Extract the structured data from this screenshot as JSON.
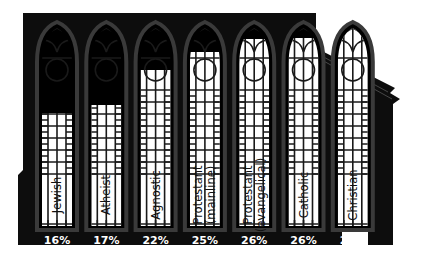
{
  "chart_data": {
    "type": "bar",
    "title": "",
    "xlabel": "",
    "ylabel": "",
    "ylim": [
      0,
      28
    ],
    "grid": false,
    "legend": null,
    "style": "pictogram: church facade with stained-glass windows filled to each value",
    "categories": [
      "Jewish",
      "Atheist",
      "Agnostic",
      "Protestant (mainline)",
      "Protestant (evangelical)",
      "Catholic",
      "Christian"
    ],
    "category_lines": [
      [
        "Jewish"
      ],
      [
        "Atheist"
      ],
      [
        "Agnostic"
      ],
      [
        "Protestant",
        "(mainline)"
      ],
      [
        "Protestant",
        "(evangelical)"
      ],
      [
        "Catholic"
      ],
      [
        "Christian"
      ]
    ],
    "values": [
      16,
      17,
      22,
      25,
      26,
      26,
      28
    ],
    "value_labels": [
      "16%",
      "17%",
      "22%",
      "25%",
      "26%",
      "26%",
      "28%"
    ]
  },
  "colors": {
    "building": "#0d0d0d",
    "window_frame": "#3a3a3a",
    "glass_fill": "#ffffff",
    "lead_lines": "#1a1a1a",
    "label_text": "#111111",
    "value_text": "#ffffff"
  }
}
